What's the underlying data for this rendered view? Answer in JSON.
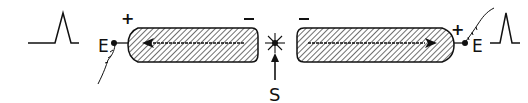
{
  "diagram": {
    "left_pulse": {
      "label": ""
    },
    "left_electrode": {
      "label": "E",
      "polarity_outer": "+",
      "polarity_inner": "−"
    },
    "right_electrode": {
      "label": "E",
      "polarity_outer": "+",
      "polarity_inner": "−"
    },
    "source": {
      "label": "S"
    },
    "colors": {
      "stroke": "#111111",
      "background": "#ffffff"
    }
  }
}
